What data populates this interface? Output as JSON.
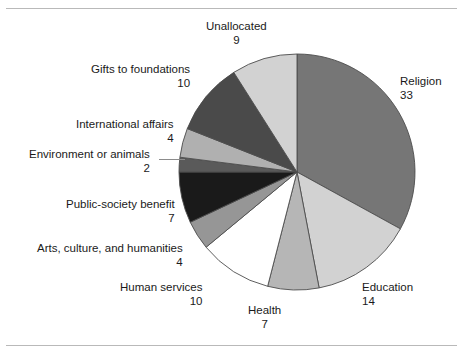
{
  "figure": {
    "background": "#ffffff",
    "frame_rule_color": "#b9b9b9"
  },
  "chart_data": {
    "type": "pie",
    "title": "",
    "subtitle": "",
    "xlabel": "",
    "ylabel": "",
    "units": "percent",
    "total": 100,
    "start_angle_deg": 0,
    "direction": "clockwise",
    "legend": "none (direct slice labels with leader text)",
    "grid": false,
    "categories": [
      "Religion",
      "Education",
      "Health",
      "Human services",
      "Arts, culture, and humanities",
      "Public-society benefit",
      "Environment or animals",
      "International affairs",
      "Gifts to foundations",
      "Unallocated"
    ],
    "values": [
      33,
      14,
      7,
      10,
      4,
      7,
      2,
      4,
      10,
      9
    ],
    "colors": [
      "#767676",
      "#d2d2d2",
      "#b6b6b6",
      "#ffffff",
      "#969696",
      "#1a1a1a",
      "#5a5a5a",
      "#b0b0b0",
      "#4a4a4a",
      "#d2d2d2"
    ],
    "slice_outline": "#4d4d4d",
    "slices": [
      {
        "label": "Religion",
        "value": 33,
        "color": "#767676"
      },
      {
        "label": "Education",
        "value": 14,
        "color": "#d2d2d2"
      },
      {
        "label": "Health",
        "value": 7,
        "color": "#b6b6b6"
      },
      {
        "label": "Human services",
        "value": 10,
        "color": "#ffffff"
      },
      {
        "label": "Arts, culture, and humanities",
        "value": 4,
        "color": "#969696"
      },
      {
        "label": "Public-society benefit",
        "value": 7,
        "color": "#1a1a1a"
      },
      {
        "label": "Environment or animals",
        "value": 2,
        "color": "#5a5a5a"
      },
      {
        "label": "International affairs",
        "value": 4,
        "color": "#b0b0b0"
      },
      {
        "label": "Gifts to foundations",
        "value": 10,
        "color": "#4a4a4a"
      },
      {
        "label": "Unallocated",
        "value": 9,
        "color": "#d2d2d2"
      }
    ]
  },
  "labels": {
    "unallocated": {
      "name": "Unallocated",
      "value": "9"
    },
    "gifts": {
      "name": "Gifts to foundations",
      "value": "10"
    },
    "international": {
      "name": "International affairs",
      "value": "4"
    },
    "environment": {
      "name": "Environment or animals",
      "value": "2"
    },
    "public": {
      "name": "Public-society benefit",
      "value": "7"
    },
    "arts": {
      "name": "Arts, culture, and humanities",
      "value": "4"
    },
    "human": {
      "name": "Human services",
      "value": "10"
    },
    "health": {
      "name": "Health",
      "value": "7"
    },
    "education": {
      "name": "Education",
      "value": "14"
    },
    "religion": {
      "name": "Religion",
      "value": "33"
    }
  }
}
